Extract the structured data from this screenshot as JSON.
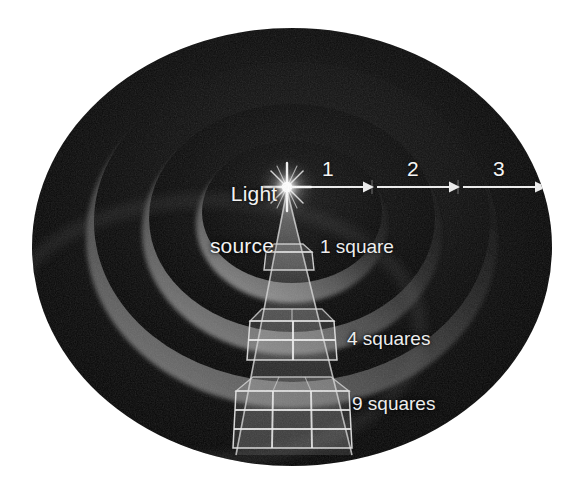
{
  "figure": {
    "background_color": "#ffffff",
    "light_source": {
      "label_line1": "Light",
      "label_line2": "source",
      "x": 287,
      "y": 187,
      "color": "#ffffff"
    },
    "distance_axis": {
      "ticks": [
        {
          "label": "1",
          "x": 322
        },
        {
          "label": "2",
          "x": 407
        },
        {
          "label": "3",
          "x": 493
        }
      ],
      "arrow_color": "#f0f0f0",
      "baseline_y": 187
    },
    "area_labels": [
      {
        "label": "1 square",
        "distance": 1,
        "squares": 1
      },
      {
        "label": "4 squares",
        "distance": 2,
        "squares": 4
      },
      {
        "label": "9 squares",
        "distance": 3,
        "squares": 9
      }
    ],
    "shells": {
      "count": 3,
      "fill_dark": "#0d0d0d",
      "rim_highlight": "#8a8a8a"
    },
    "cone": {
      "edge_color": "#d8d8d8",
      "grid_color": "#cfcfcf"
    }
  }
}
